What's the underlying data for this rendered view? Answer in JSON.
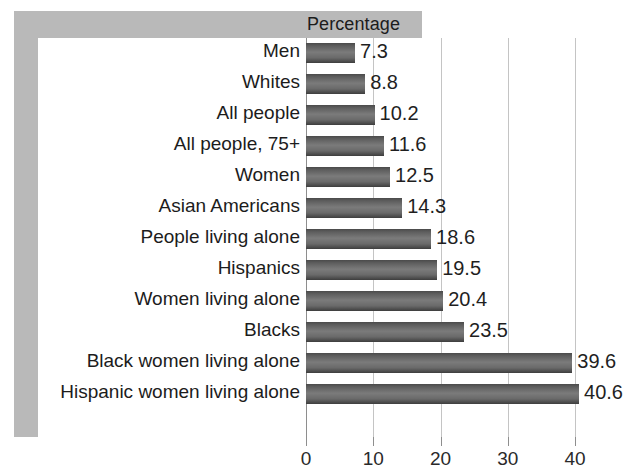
{
  "header": {
    "title": "Percentage"
  },
  "chart_data": {
    "type": "bar",
    "orientation": "horizontal",
    "title": "Percentage",
    "xlabel": "",
    "ylabel": "",
    "xlim": [
      0,
      40
    ],
    "grid": true,
    "legend": "none",
    "xticks": [
      "0",
      "10",
      "20",
      "30",
      "40"
    ],
    "xtick_values": [
      0,
      10,
      20,
      30,
      40
    ],
    "categories": [
      "Men",
      "Whites",
      "All people",
      "All people, 75+",
      "Women",
      "Asian Americans",
      "People living alone",
      "Hispanics",
      "Women living alone",
      "Blacks",
      "Black women living alone",
      "Hispanic women living alone"
    ],
    "values": [
      7.3,
      8.8,
      10.2,
      11.6,
      12.5,
      14.3,
      18.6,
      19.5,
      20.4,
      23.5,
      39.6,
      40.6
    ],
    "value_labels": [
      "7.3",
      "8.8",
      "10.2",
      "11.6",
      "12.5",
      "14.3",
      "18.6",
      "19.5",
      "20.4",
      "23.5",
      "39.6",
      "40.6"
    ],
    "colors": {
      "bar_dark": "#3d3d3d",
      "bar_light": "#7b7b7b",
      "frame": "#b9b9b9",
      "gridline": "#c4c4c4",
      "axis": "#8e8e8e",
      "text": "#1c1c1c",
      "background": "#ffffff"
    }
  }
}
